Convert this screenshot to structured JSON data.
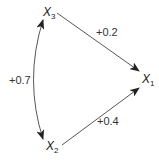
{
  "diagram": {
    "type": "path-diagram",
    "nodes": [
      {
        "id": "x1",
        "label": "X",
        "subscript": "1"
      },
      {
        "id": "x2",
        "label": "X",
        "subscript": "2"
      },
      {
        "id": "x3",
        "label": "X",
        "subscript": "3"
      }
    ],
    "edges": [
      {
        "from": "x3",
        "to": "x1",
        "type": "directed",
        "label": "+0.2"
      },
      {
        "from": "x2",
        "to": "x1",
        "type": "directed",
        "label": "+0.4"
      },
      {
        "from": "x3",
        "to": "x2",
        "type": "bidirectional-curved",
        "label": "+0.7"
      }
    ],
    "colors": {
      "line": "#333333",
      "text": "#222222",
      "background": "#ffffff"
    }
  }
}
